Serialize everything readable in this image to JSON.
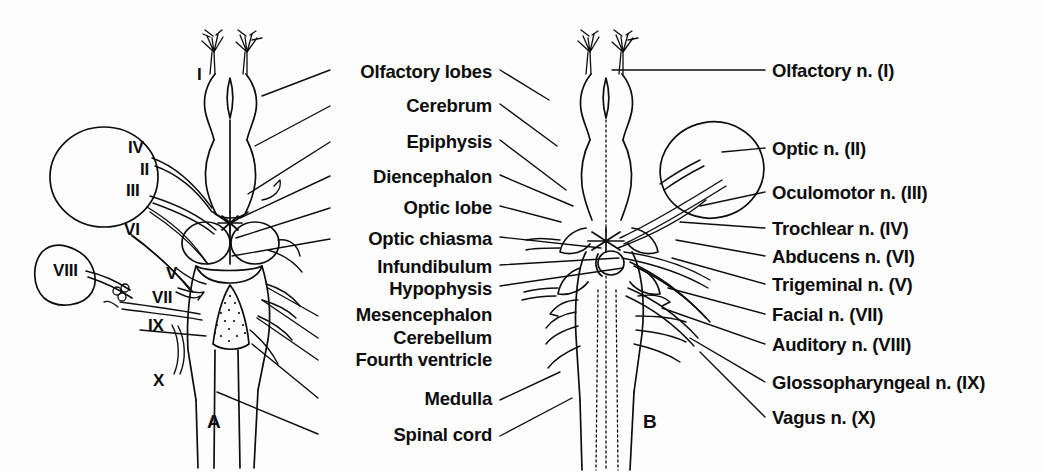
{
  "figure": {
    "type": "anatomical-diagram",
    "background_color": "#fdfdfd",
    "ink_color": "#0d0d0d",
    "panels": [
      {
        "id": "A",
        "label": "A",
        "view": "dorsal",
        "x": 207,
        "y": 424
      },
      {
        "id": "B",
        "label": "B",
        "view": "ventral",
        "x": 643,
        "y": 424
      }
    ]
  },
  "center_labels": {
    "align": "right",
    "right_edge_x": 492,
    "items": [
      {
        "text": "Olfactory lobes",
        "y": 63,
        "leader": [
          [
            500,
            70
          ],
          [
            548,
            100
          ]
        ]
      },
      {
        "text": "Cerebrum",
        "y": 98,
        "leader": [
          [
            500,
            104
          ],
          [
            556,
            146
          ]
        ]
      },
      {
        "text": "Epiphysis",
        "y": 134,
        "leader": [
          [
            500,
            140
          ],
          [
            565,
            190
          ]
        ]
      },
      {
        "text": "Diencephalon",
        "y": 169,
        "leader": [
          [
            500,
            175
          ],
          [
            572,
            206
          ]
        ]
      },
      {
        "text": "Optic lobe",
        "y": 200,
        "leader": [
          [
            500,
            206
          ],
          [
            560,
            222
          ]
        ]
      },
      {
        "text": "Optic chiasma",
        "y": 231,
        "leader": [
          [
            500,
            237
          ],
          [
            600,
            248
          ]
        ]
      },
      {
        "text": "Infundibulum",
        "y": 261,
        "leader": [
          [
            500,
            265
          ],
          [
            618,
            258
          ]
        ]
      },
      {
        "text": "Hypophysis",
        "y": 283,
        "leader": [
          [
            500,
            286
          ],
          [
            622,
            268
          ]
        ]
      },
      {
        "text": "Mesencephalon",
        "y": 310,
        "leader": [
          [
            318,
            316
          ],
          [
            268,
            288
          ]
        ]
      },
      {
        "text": "Cerebellum",
        "y": 333,
        "leader": [
          [
            318,
            338
          ],
          [
            262,
            300
          ]
        ]
      },
      {
        "text": "Fourth ventricle",
        "y": 355,
        "leader": [
          [
            318,
            360
          ],
          [
            258,
            318
          ]
        ]
      },
      {
        "text": "Medulla",
        "y": 394,
        "leader": [
          [
            318,
            398
          ],
          [
            252,
            345
          ]
        ]
      },
      {
        "text": "Spinal cord",
        "y": 430,
        "leader": [
          [
            318,
            434
          ],
          [
            218,
            392
          ]
        ]
      }
    ]
  },
  "right_labels": {
    "align": "left",
    "left_edge_x": 772,
    "items": [
      {
        "text": "Olfactory n. (I)",
        "y": 63,
        "leader": [
          [
            765,
            70
          ],
          [
            612,
            70
          ]
        ]
      },
      {
        "text": "Optic n. (II)",
        "y": 142,
        "leader": [
          [
            765,
            148
          ],
          [
            718,
            152
          ]
        ]
      },
      {
        "text": "Oculomotor n. (III)",
        "y": 186,
        "leader": [
          [
            765,
            192
          ],
          [
            700,
            205
          ]
        ]
      },
      {
        "text": "Trochlear n. (IV)",
        "y": 222,
        "leader": [
          [
            765,
            228
          ],
          [
            680,
            222
          ]
        ]
      },
      {
        "text": "Abducens n. (VI)",
        "y": 251,
        "leader": [
          [
            765,
            256
          ],
          [
            676,
            240
          ]
        ]
      },
      {
        "text": "Trigeminal n. (V)",
        "y": 279,
        "leader": [
          [
            765,
            284
          ],
          [
            672,
            258
          ]
        ]
      },
      {
        "text": "Facial n. (VII)",
        "y": 309,
        "leader": [
          [
            765,
            314
          ],
          [
            668,
            288
          ]
        ]
      },
      {
        "text": "Auditory n. (VIII)",
        "y": 339,
        "leader": [
          [
            765,
            344
          ],
          [
            662,
            306
          ]
        ]
      },
      {
        "text": "Glossopharyngeal n. (IX)",
        "y": 377,
        "leader": [
          [
            765,
            382
          ],
          [
            690,
            338
          ]
        ]
      },
      {
        "text": "Vagus n. (X)",
        "y": 412,
        "leader": [
          [
            765,
            417
          ],
          [
            700,
            352
          ]
        ]
      }
    ]
  },
  "roman_numerals_panel_a": [
    {
      "text": "I",
      "x": 197,
      "y": 66
    },
    {
      "text": "IV",
      "x": 128,
      "y": 139
    },
    {
      "text": "II",
      "x": 140,
      "y": 161
    },
    {
      "text": "III",
      "x": 126,
      "y": 182
    },
    {
      "text": "VI",
      "x": 124,
      "y": 221
    },
    {
      "text": "VIII",
      "x": 53,
      "y": 262
    },
    {
      "text": "V",
      "x": 166,
      "y": 265
    },
    {
      "text": "VII",
      "x": 152,
      "y": 289
    },
    {
      "text": "IX",
      "x": 148,
      "y": 317
    },
    {
      "text": "X",
      "x": 153,
      "y": 372
    }
  ]
}
